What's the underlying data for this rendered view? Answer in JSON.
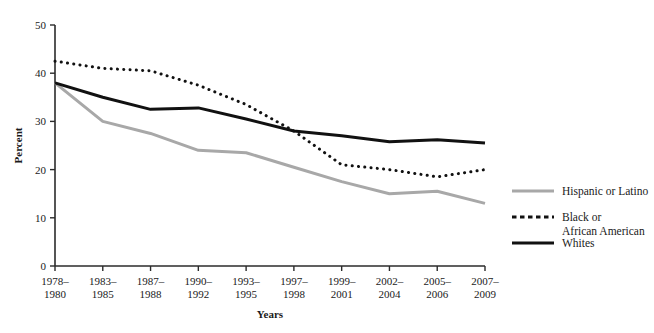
{
  "chart_data": {
    "type": "line",
    "title": "",
    "xlabel": "Years",
    "ylabel": "Percent",
    "ylim": [
      0,
      50
    ],
    "yticks": [
      0,
      10,
      20,
      30,
      40,
      50
    ],
    "grid": false,
    "legend_position": "right",
    "categories": [
      "1978–\n1980",
      "1983–\n1985",
      "1987–\n1988",
      "1990–\n1992",
      "1993–\n1995",
      "1997–\n1998",
      "1999–\n2001",
      "2002–\n2004",
      "2005–\n2006",
      "2007–\n2009"
    ],
    "categories_line1": [
      "1978–",
      "1983–",
      "1987–",
      "1990–",
      "1993–",
      "1997–",
      "1999–",
      "2002–",
      "2005–",
      "2007–"
    ],
    "categories_line2": [
      "1980",
      "1985",
      "1988",
      "1992",
      "1995",
      "1998",
      "2001",
      "2004",
      "2006",
      "2009"
    ],
    "series": [
      {
        "name": "Hispanic or Latino",
        "style": "solid",
        "color": "#a8a8a8",
        "width": 3.0,
        "values": [
          38.0,
          30.0,
          27.5,
          24.0,
          23.5,
          20.5,
          17.5,
          15.0,
          15.5,
          13.0
        ]
      },
      {
        "name": "Black or African American",
        "style": "dotted",
        "color": "#111111",
        "width": 3.0,
        "values": [
          42.5,
          41.0,
          40.5,
          37.5,
          33.5,
          28.0,
          21.0,
          20.0,
          18.5,
          20.0
        ]
      },
      {
        "name": "Whites",
        "style": "solid",
        "color": "#111111",
        "width": 3.0,
        "values": [
          38.0,
          35.0,
          32.5,
          32.8,
          30.5,
          28.0,
          27.0,
          25.8,
          26.2,
          25.5
        ]
      }
    ]
  },
  "legend": {
    "entries": [
      {
        "label": "Hispanic or Latino",
        "label_line2": ""
      },
      {
        "label": "Black or",
        "label_line2": "African American"
      },
      {
        "label": "Whites",
        "label_line2": ""
      }
    ]
  },
  "colors": {
    "hispanic": "#a8a8a8",
    "black_african_american": "#111111",
    "whites": "#111111",
    "axis": "#2b2b2b",
    "text": "#1a1a1a",
    "background": "#ffffff"
  }
}
